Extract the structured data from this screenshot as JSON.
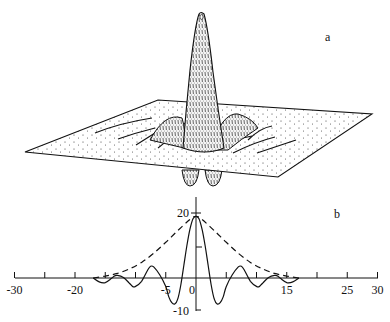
{
  "figure": {
    "panel_a_label": "a",
    "panel_b_label": "b"
  },
  "chart_data": [
    {
      "panel": "a",
      "type": "surface",
      "title": "",
      "description": "3D perspective surface plot of a radially oscillating peak on a stippled plane; single tall central peak with side ridges and two negative lobes below the plane",
      "xlabel": "",
      "ylabel": "",
      "zlabel": ""
    },
    {
      "panel": "b",
      "type": "line",
      "title": "",
      "xlabel": "",
      "ylabel": "",
      "xlim": [
        -30,
        30
      ],
      "ylim": [
        -10,
        20
      ],
      "x_ticks": [
        -30,
        -25,
        -20,
        -15,
        -10,
        -5,
        0,
        5,
        10,
        15,
        20,
        25,
        30
      ],
      "x_tick_labels": [
        "-30",
        "-20",
        "-5",
        "0",
        "15",
        "25",
        "30"
      ],
      "x_tick_label_positions": [
        -30,
        -20,
        -5,
        0,
        15,
        25,
        30
      ],
      "y_tick_labels": [
        "20",
        "-10"
      ],
      "y_ticks": [
        20,
        10,
        -10
      ],
      "grid": false,
      "legend": [],
      "series": [
        {
          "name": "solid",
          "style": "solid",
          "x": [
            -17,
            -16,
            -15,
            -14,
            -13.5,
            -13,
            -12,
            -11,
            -10.5,
            -10,
            -9,
            -8,
            -7.5,
            -7,
            -6,
            -5,
            -4.5,
            -4,
            -3.5,
            -3,
            -2.5,
            -2,
            -1.5,
            -1,
            -0.5,
            0,
            0.5,
            1,
            1.5,
            2,
            2.5,
            3,
            3.5,
            4,
            4.5,
            5,
            6,
            7,
            7.5,
            8,
            9,
            10,
            10.5,
            11,
            12,
            13,
            13.5,
            14,
            15,
            16,
            17
          ],
          "values": [
            0,
            -1.2,
            -1.4,
            -0.2,
            0.6,
            0.8,
            0.2,
            -1.6,
            -2.6,
            -2.6,
            -1.0,
            2.4,
            3.6,
            3.4,
            1.0,
            -2.6,
            -5.8,
            -7.6,
            -8.0,
            -6.4,
            -2.0,
            4.0,
            10.0,
            15.0,
            18.2,
            19.0,
            18.2,
            15.0,
            10.0,
            4.0,
            -2.0,
            -6.4,
            -8.0,
            -7.6,
            -5.8,
            -2.6,
            1.0,
            3.4,
            3.6,
            2.4,
            -1.0,
            -2.6,
            -2.6,
            -1.6,
            0.2,
            0.8,
            0.6,
            -0.2,
            -1.4,
            -1.2,
            0
          ]
        },
        {
          "name": "dashed",
          "style": "dashed",
          "x": [
            -17,
            -15,
            -13,
            -11,
            -9,
            -7,
            -5,
            -3,
            -1,
            0,
            1,
            3,
            5,
            7,
            9,
            11,
            13,
            15,
            17
          ],
          "values": [
            0.0,
            0.6,
            1.4,
            2.8,
            4.8,
            7.6,
            11.0,
            14.6,
            18.0,
            19.0,
            18.0,
            14.6,
            11.0,
            7.6,
            4.8,
            2.8,
            1.4,
            0.6,
            0.0
          ]
        }
      ],
      "annotations": [
        {
          "type": "tick",
          "axis": "y",
          "value": 10,
          "note": "short tick mark on right side of y-axis"
        }
      ]
    }
  ]
}
